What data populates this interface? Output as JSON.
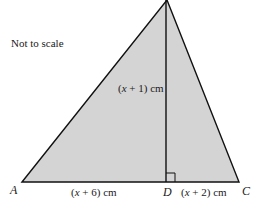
{
  "diagram": {
    "note": "Not to scale",
    "colors": {
      "fill": "#d4d4d4",
      "stroke": "#111111",
      "text": "#1a1a1a"
    },
    "points": {
      "A": {
        "label": "A",
        "x": 22,
        "y": 182
      },
      "B": {
        "label": "",
        "x": 167,
        "y": 0
      },
      "C": {
        "label": "C",
        "x": 239,
        "y": 182
      },
      "D": {
        "label": "D",
        "x": 166,
        "y": 182
      }
    },
    "edges": [
      {
        "from": "A",
        "to": "B"
      },
      {
        "from": "B",
        "to": "C"
      },
      {
        "from": "A",
        "to": "C"
      },
      {
        "from": "B",
        "to": "D"
      }
    ],
    "right_angle": {
      "at": "D",
      "size": 9
    },
    "lengths": {
      "height_BD": {
        "pre": "(",
        "var": "x",
        "post": " + 1) cm"
      },
      "AD": {
        "pre": "(",
        "var": "x",
        "post": " + 6) cm"
      },
      "DC": {
        "pre": "(",
        "var": "x",
        "post": " + 2) cm"
      }
    }
  }
}
